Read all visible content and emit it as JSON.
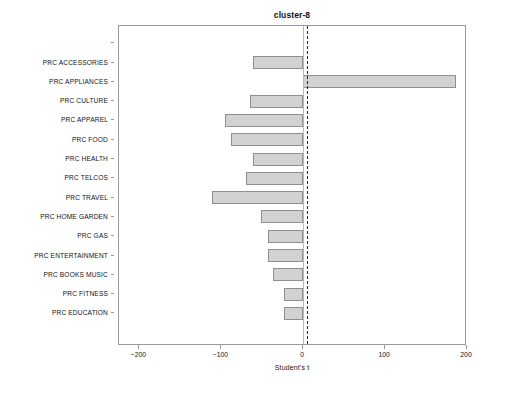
{
  "chart_data": {
    "type": "bar",
    "orientation": "horizontal",
    "title": "cluster-8",
    "xlabel": "Student's t",
    "ylabel": "",
    "xlim": [
      -225,
      200
    ],
    "xticks": [
      -200,
      -100,
      0,
      100,
      200
    ],
    "xtick_labels": [
      "−200",
      "−100",
      "0",
      "100",
      "200"
    ],
    "grid": false,
    "legend": null,
    "reference_line": {
      "value": 5,
      "style": "dashed",
      "color": "#2b2b2b"
    },
    "bar_style": {
      "fill": "#d2d2d2",
      "edge": "#8f8f8f"
    },
    "categories": [
      "PRC ACCESSORIES",
      "PRC APPLIANCES",
      "PRC CULTURE",
      "PRC APPAREL",
      "PRC FOOD",
      "PRC HEALTH",
      "PRC TELCOS",
      "PRC TRAVEL",
      "PRC HOME GARDEN",
      "PRC GAS",
      "PRC ENTERTAINMENT",
      "PRC BOOKS MUSIC",
      "PRC FITNESS",
      "PRC EDUCATION"
    ],
    "values": [
      -61,
      187,
      -65,
      -95,
      -88,
      -61,
      -70,
      -111,
      -51,
      -43,
      -43,
      -37,
      -23,
      -24
    ]
  }
}
